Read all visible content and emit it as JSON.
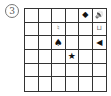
{
  "problem_label": "3",
  "grid": {
    "rows": 6,
    "cols": 6,
    "cells": [
      [
        "",
        "",
        "",
        "",
        "◆",
        "🔊"
      ],
      [
        "",
        "",
        "♮",
        "",
        "",
        "⊔"
      ],
      [
        "",
        "",
        "♠",
        "",
        "",
        "◀"
      ],
      [
        "",
        "",
        "",
        "★",
        "",
        ""
      ],
      [
        "",
        "",
        "",
        "",
        "",
        ""
      ],
      [
        "",
        "",
        "",
        "",
        "",
        ""
      ]
    ],
    "cell_icons": [
      {
        "row": 1,
        "col": 5,
        "name": "diamond-icon"
      },
      {
        "row": 1,
        "col": 6,
        "name": "speaker-icon"
      },
      {
        "row": 2,
        "col": 3,
        "name": "small-figure-icon"
      },
      {
        "row": 2,
        "col": 6,
        "name": "bracket-icon"
      },
      {
        "row": 3,
        "col": 3,
        "name": "spade-icon"
      },
      {
        "row": 3,
        "col": 6,
        "name": "left-triangle-icon"
      },
      {
        "row": 4,
        "col": 4,
        "name": "star-icon"
      }
    ]
  }
}
